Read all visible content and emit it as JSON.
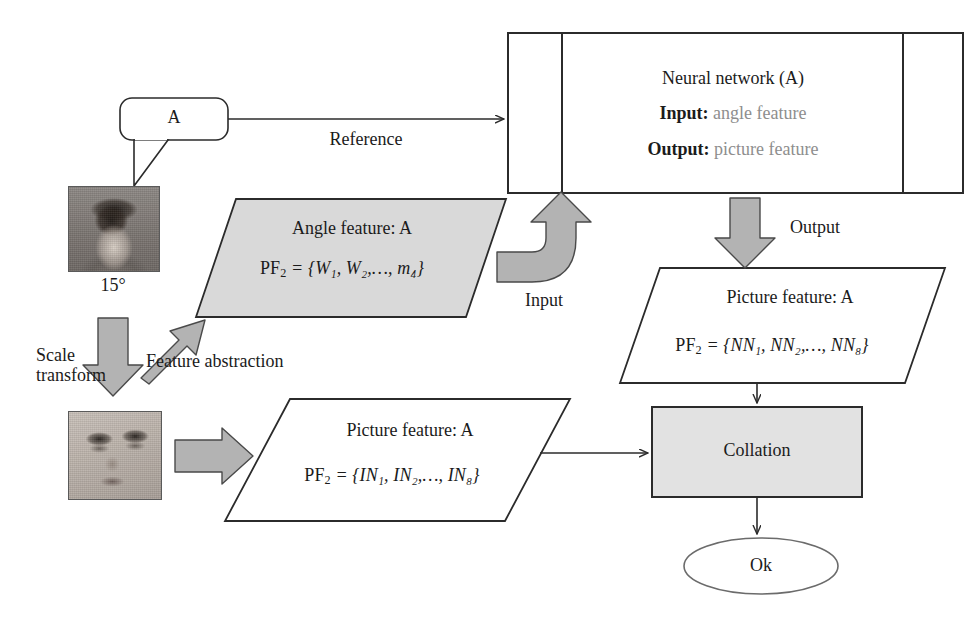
{
  "diagram": {
    "colors": {
      "stroke": "#2b2b2b",
      "fill_grey": "#d9d9d9",
      "arrow_grey": "#b3b3b3",
      "muted_text": "#8e8e8e",
      "background": "#ffffff"
    }
  },
  "callout": {
    "label": "A"
  },
  "photos": {
    "portrait": {
      "angle_label": "15°",
      "alt": "portrait-photo-head-and-shoulders"
    },
    "face": {
      "alt": "cropped-face-photo"
    }
  },
  "neural_network": {
    "title": "Neural network (A)",
    "input_label": "Input:",
    "input_value": "angle feature",
    "output_label": "Output:",
    "output_value": "picture feature"
  },
  "angle_feature": {
    "title": "Angle feature: A",
    "formula_lhs": "PF",
    "formula_lhs_sub": "2",
    "formula_rhs": "= {W₁, W₂,…, m₄}",
    "formula_plain": "PF2 = {W1, W2,..., m4}"
  },
  "picture_feature_nn": {
    "title": "Picture feature: A",
    "formula_lhs": "PF",
    "formula_lhs_sub": "2",
    "formula_rhs": "= {NN₁, NN₂,…, NN₈}",
    "formula_plain": "PF2 = {NN1, NN2,..., NN8}"
  },
  "picture_feature_in": {
    "title": "Picture feature: A",
    "formula_lhs": "PF",
    "formula_lhs_sub": "2",
    "formula_rhs": "= {IN₁, IN₂,…, IN₈}",
    "formula_plain": "PF2 = {IN1, IN2,..., IN8}"
  },
  "collation": {
    "label": "Collation"
  },
  "result": {
    "label": "Ok"
  },
  "edge_labels": {
    "reference": "Reference",
    "input": "Input",
    "output": "Output",
    "scale_transform_line1": "Scale",
    "scale_transform_line2": "transform",
    "feature_abstraction": "Feature abstraction"
  }
}
